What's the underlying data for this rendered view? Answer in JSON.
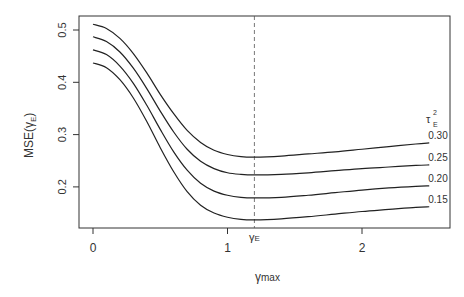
{
  "chart_data": {
    "type": "line",
    "title": "",
    "xlabel": "γmax",
    "ylabel": "MSE(γE)",
    "xlim": [
      -0.05,
      2.6
    ],
    "ylim": [
      0.125,
      0.52
    ],
    "xticks": [
      "0",
      "1",
      "2"
    ],
    "yticks": [
      "0.2",
      "0.3",
      "0.4",
      "0.5"
    ],
    "grid": false,
    "legend_title": "τE²",
    "legend_position": "right-inline",
    "vline": {
      "x": 1.2,
      "label": "γE",
      "style": "dashed"
    },
    "x": [
      0,
      0.1,
      0.2,
      0.3,
      0.4,
      0.5,
      0.6,
      0.7,
      0.8,
      0.9,
      1.0,
      1.1,
      1.2,
      1.4,
      1.6,
      1.8,
      2.0,
      2.2,
      2.4,
      2.5
    ],
    "series": [
      {
        "name": "0.30",
        "values": [
          0.511,
          0.503,
          0.484,
          0.455,
          0.418,
          0.377,
          0.34,
          0.308,
          0.285,
          0.27,
          0.262,
          0.258,
          0.257,
          0.259,
          0.263,
          0.267,
          0.272,
          0.277,
          0.282,
          0.284
        ]
      },
      {
        "name": "0.25",
        "values": [
          0.487,
          0.478,
          0.458,
          0.427,
          0.388,
          0.345,
          0.305,
          0.272,
          0.249,
          0.235,
          0.227,
          0.224,
          0.223,
          0.224,
          0.227,
          0.231,
          0.235,
          0.238,
          0.241,
          0.242
        ]
      },
      {
        "name": "0.20",
        "values": [
          0.462,
          0.453,
          0.431,
          0.398,
          0.356,
          0.31,
          0.267,
          0.232,
          0.207,
          0.192,
          0.184,
          0.18,
          0.179,
          0.18,
          0.184,
          0.189,
          0.194,
          0.198,
          0.201,
          0.202
        ]
      },
      {
        "name": "0.15",
        "values": [
          0.437,
          0.428,
          0.405,
          0.37,
          0.325,
          0.275,
          0.229,
          0.191,
          0.165,
          0.15,
          0.142,
          0.138,
          0.137,
          0.139,
          0.143,
          0.148,
          0.153,
          0.157,
          0.161,
          0.162
        ]
      }
    ]
  },
  "labels": {
    "ylabel_main": "MSE(",
    "ylabel_gamma": "γ",
    "ylabel_sub": "E",
    "ylabel_close": ")",
    "xlabel_main": "γ",
    "xlabel_sub": "max",
    "vline_main": "γ",
    "vline_sub": "E",
    "legend_tau": "τ",
    "legend_sup": "2",
    "legend_sub": "E"
  }
}
